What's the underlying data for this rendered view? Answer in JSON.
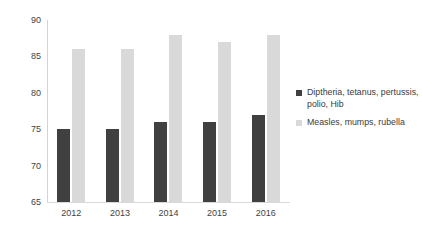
{
  "chart_data": {
    "type": "bar",
    "title": "",
    "xlabel": "",
    "ylabel": "Percentage (%) vaccinated",
    "categories": [
      "2012",
      "2013",
      "2014",
      "2015",
      "2016"
    ],
    "series": [
      {
        "name": "Diptheria, tetanus, pertussis, polio, Hib",
        "color": "#404040",
        "values": [
          75,
          75,
          76,
          76,
          77
        ]
      },
      {
        "name": "Measles, mumps, rubella",
        "color": "#D9D9D9",
        "values": [
          86,
          86,
          88,
          87,
          88
        ]
      }
    ],
    "ylim": [
      65,
      90
    ],
    "yticks": [
      "65",
      "70",
      "75",
      "80",
      "85",
      "90"
    ],
    "grid": false,
    "legend_position": "right"
  },
  "axes": {
    "y_title": "Percentage (%) vaccinated"
  },
  "legend": {
    "entries": [
      {
        "label": "Diptheria, tetanus, pertussis, polio, Hib",
        "color": "#404040"
      },
      {
        "label": "Measles, mumps, rubella",
        "color": "#D9D9D9"
      }
    ]
  },
  "title_strip": {
    "text": ""
  }
}
